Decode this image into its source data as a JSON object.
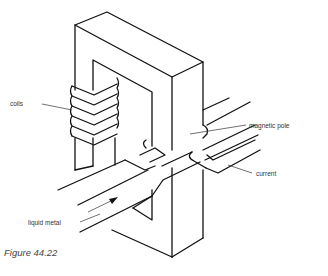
{
  "figure": {
    "caption": "Figure 44.22",
    "labels": {
      "coils": "coils",
      "magnetic_pole": "magnetic pole",
      "current": "current",
      "liquid_metal": "liquid metal"
    },
    "colors": {
      "line": "#111111",
      "text": "#333333",
      "background": "#ffffff"
    }
  }
}
